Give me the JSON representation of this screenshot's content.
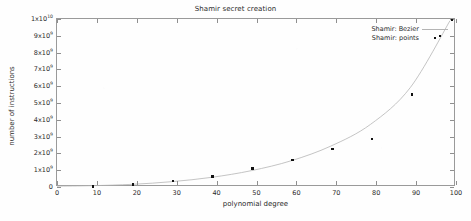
{
  "chart_data": {
    "type": "scatter",
    "title": "Shamir secret creation",
    "xlabel": "polynomial degree",
    "ylabel": "number of instructions",
    "xlim": [
      0,
      100
    ],
    "ylim": [
      0,
      10000000000.0
    ],
    "grid": false,
    "legend_position": "top-right inside",
    "xticks": [
      {
        "value": 0,
        "label": "0"
      },
      {
        "value": 10,
        "label": "10"
      },
      {
        "value": 20,
        "label": "20"
      },
      {
        "value": 30,
        "label": "30"
      },
      {
        "value": 40,
        "label": "40"
      },
      {
        "value": 50,
        "label": "50"
      },
      {
        "value": 60,
        "label": "60"
      },
      {
        "value": 70,
        "label": "70"
      },
      {
        "value": 80,
        "label": "80"
      },
      {
        "value": 90,
        "label": "90"
      },
      {
        "value": 100,
        "label": "100"
      }
    ],
    "yticks": [
      {
        "value": 0,
        "mantissa": "0",
        "exponent": ""
      },
      {
        "value": 1000000000.0,
        "mantissa": "1x10",
        "exponent": "9"
      },
      {
        "value": 2000000000.0,
        "mantissa": "2x10",
        "exponent": "9"
      },
      {
        "value": 3000000000.0,
        "mantissa": "3x10",
        "exponent": "9"
      },
      {
        "value": 4000000000.0,
        "mantissa": "4x10",
        "exponent": "9"
      },
      {
        "value": 5000000000.0,
        "mantissa": "5x10",
        "exponent": "9"
      },
      {
        "value": 6000000000.0,
        "mantissa": "6x10",
        "exponent": "9"
      },
      {
        "value": 7000000000.0,
        "mantissa": "7x10",
        "exponent": "9"
      },
      {
        "value": 8000000000.0,
        "mantissa": "8x10",
        "exponent": "9"
      },
      {
        "value": 9000000000.0,
        "mantissa": "9x10",
        "exponent": "9"
      },
      {
        "value": 10000000000.0,
        "mantissa": "1x10",
        "exponent": "10"
      }
    ],
    "series": [
      {
        "name": "Shamir: Bezier",
        "kind": "line",
        "color": "#b4b4b4",
        "points": [
          {
            "x": 9,
            "y": 30000000
          },
          {
            "x": 19,
            "y": 110000000
          },
          {
            "x": 29,
            "y": 270000000
          },
          {
            "x": 39,
            "y": 530000000
          },
          {
            "x": 49,
            "y": 930000000
          },
          {
            "x": 59,
            "y": 1520000000
          },
          {
            "x": 69,
            "y": 2400000000
          },
          {
            "x": 79,
            "y": 3700000000
          },
          {
            "x": 89,
            "y": 5900000000
          },
          {
            "x": 99,
            "y": 9900000000
          }
        ]
      },
      {
        "name": "Shamir: points",
        "kind": "scatter",
        "color": "#111111",
        "points": [
          {
            "x": 9,
            "y": 40000000
          },
          {
            "x": 19,
            "y": 140000000
          },
          {
            "x": 29,
            "y": 340000000
          },
          {
            "x": 39,
            "y": 620000000
          },
          {
            "x": 49,
            "y": 1100000000
          },
          {
            "x": 59,
            "y": 1620000000
          },
          {
            "x": 69,
            "y": 2260000000
          },
          {
            "x": 79,
            "y": 2840000000
          },
          {
            "x": 89,
            "y": 5500000000
          },
          {
            "x": 96,
            "y": 9000000000
          },
          {
            "x": 99,
            "y": 9950000000
          }
        ]
      }
    ]
  }
}
